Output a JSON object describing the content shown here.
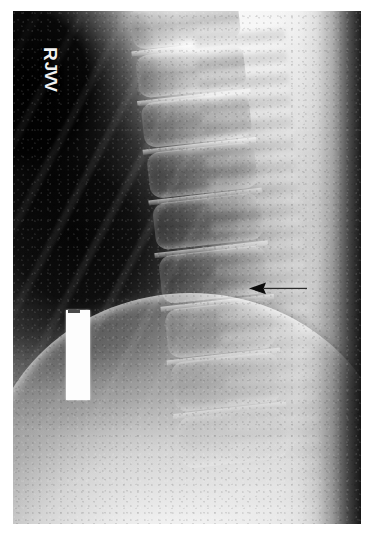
{
  "image": {
    "modality": "X-ray radiograph",
    "view": "lateral thoracic spine",
    "width_px": 373,
    "height_px": 546,
    "border_color": "#ffffff",
    "film_tone_dark": "#000000",
    "film_tone_light": "#ffffff"
  },
  "annotations": {
    "side_marker": {
      "label": "R",
      "meaning": "right side marker",
      "rotation_deg": 90,
      "color": "#f2f2f2"
    },
    "technologist_initials": {
      "label": "JVV",
      "rotation_deg": 90,
      "color": "#f2f2f2"
    },
    "id_label": {
      "text": "",
      "description": "blank white redaction strip covering patient identification",
      "color": "#fdfdfd"
    },
    "pointer_arrow": {
      "text": "",
      "direction": "left",
      "color": "#000000",
      "description": "arrow indicating vertebral body finding",
      "tip_x": 252,
      "tip_y": 283,
      "tail_x": 305
    }
  },
  "anatomy": {
    "regions": [
      {
        "name": "lung-field",
        "label": "lung field",
        "tone": "dark"
      },
      {
        "name": "vertebral-column",
        "label": "thoracic vertebral bodies",
        "tone": "mid"
      },
      {
        "name": "posterior-elements",
        "label": "posterior elements",
        "tone": "bright"
      },
      {
        "name": "diaphragm",
        "label": "diaphragm / upper abdomen",
        "tone": "bright"
      },
      {
        "name": "soft-tissue-back",
        "label": "posterior soft tissue",
        "tone": "bright"
      }
    ],
    "vertebrae": [
      {
        "level": "T4",
        "top_pct": 2,
        "height_pct": 8.0
      },
      {
        "level": "T5",
        "top_pct": 11,
        "height_pct": 8.2
      },
      {
        "level": "T6",
        "top_pct": 20,
        "height_pct": 8.4
      },
      {
        "level": "T7",
        "top_pct": 29.5,
        "height_pct": 8.6
      },
      {
        "level": "T8",
        "top_pct": 39,
        "height_pct": 8.8
      },
      {
        "level": "T9",
        "top_pct": 49,
        "height_pct": 9.0
      },
      {
        "level": "T10",
        "top_pct": 59,
        "height_pct": 9.2
      },
      {
        "level": "T11",
        "top_pct": 69,
        "height_pct": 9.4
      },
      {
        "level": "T12",
        "top_pct": 79.5,
        "height_pct": 9.6
      }
    ]
  }
}
